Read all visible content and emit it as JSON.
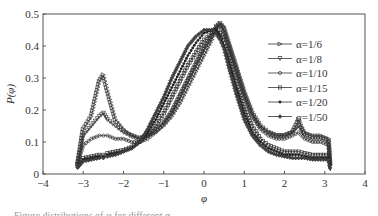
{
  "chart_data": {
    "type": "line",
    "title": "",
    "xlabel": "φ",
    "ylabel": "P(φ)",
    "xlim": [
      -4,
      4
    ],
    "ylim": [
      0,
      0.5
    ],
    "xticks": [
      "-4",
      "-3",
      "-2",
      "-1",
      "0",
      "1",
      "2",
      "3",
      "4"
    ],
    "yticks": [
      "0",
      "0.1",
      "0.2",
      "0.3",
      "0.4",
      "0.5"
    ],
    "grid": false,
    "legend_position": "upper right",
    "x": [
      -3.14,
      -3.0,
      -2.8,
      -2.6,
      -2.5,
      -2.4,
      -2.2,
      -2.0,
      -1.8,
      -1.6,
      -1.4,
      -1.2,
      -1.0,
      -0.8,
      -0.6,
      -0.4,
      -0.2,
      0.0,
      0.2,
      0.3,
      0.4,
      0.5,
      0.6,
      0.8,
      1.0,
      1.2,
      1.4,
      1.6,
      1.8,
      2.0,
      2.2,
      2.35,
      2.5,
      2.7,
      2.9,
      3.1,
      3.14
    ],
    "series": [
      {
        "name": "α=1/6",
        "marker": "triangle-right",
        "values": [
          0.03,
          0.14,
          0.18,
          0.29,
          0.31,
          0.26,
          0.17,
          0.14,
          0.12,
          0.11,
          0.12,
          0.13,
          0.15,
          0.18,
          0.22,
          0.27,
          0.32,
          0.37,
          0.42,
          0.45,
          0.47,
          0.46,
          0.42,
          0.34,
          0.26,
          0.19,
          0.15,
          0.13,
          0.12,
          0.12,
          0.13,
          0.17,
          0.13,
          0.12,
          0.12,
          0.11,
          0.02
        ]
      },
      {
        "name": "α=1/8",
        "marker": "triangle-down",
        "values": [
          0.03,
          0.12,
          0.15,
          0.18,
          0.19,
          0.17,
          0.15,
          0.13,
          0.12,
          0.11,
          0.12,
          0.14,
          0.16,
          0.19,
          0.24,
          0.29,
          0.34,
          0.39,
          0.43,
          0.46,
          0.47,
          0.45,
          0.41,
          0.33,
          0.25,
          0.19,
          0.15,
          0.13,
          0.12,
          0.12,
          0.13,
          0.15,
          0.12,
          0.11,
          0.11,
          0.1,
          0.02
        ]
      },
      {
        "name": "α=1/10",
        "marker": "circle",
        "values": [
          0.03,
          0.09,
          0.11,
          0.12,
          0.12,
          0.12,
          0.11,
          0.11,
          0.1,
          0.1,
          0.11,
          0.13,
          0.16,
          0.2,
          0.25,
          0.3,
          0.35,
          0.4,
          0.44,
          0.46,
          0.46,
          0.44,
          0.4,
          0.32,
          0.24,
          0.18,
          0.14,
          0.12,
          0.11,
          0.11,
          0.12,
          0.13,
          0.11,
          0.1,
          0.1,
          0.09,
          0.02
        ]
      },
      {
        "name": "α=1/15",
        "marker": "square",
        "values": [
          0.03,
          0.05,
          0.055,
          0.06,
          0.06,
          0.065,
          0.07,
          0.075,
          0.085,
          0.1,
          0.12,
          0.15,
          0.19,
          0.24,
          0.29,
          0.34,
          0.38,
          0.42,
          0.44,
          0.45,
          0.44,
          0.42,
          0.38,
          0.29,
          0.21,
          0.15,
          0.11,
          0.09,
          0.08,
          0.07,
          0.07,
          0.07,
          0.065,
          0.06,
          0.06,
          0.06,
          0.02
        ]
      },
      {
        "name": "α=1/20",
        "marker": "dot",
        "values": [
          0.02,
          0.045,
          0.05,
          0.055,
          0.055,
          0.06,
          0.065,
          0.07,
          0.08,
          0.1,
          0.13,
          0.17,
          0.22,
          0.27,
          0.32,
          0.37,
          0.41,
          0.44,
          0.45,
          0.45,
          0.43,
          0.4,
          0.36,
          0.27,
          0.19,
          0.13,
          0.1,
          0.08,
          0.07,
          0.06,
          0.06,
          0.06,
          0.055,
          0.05,
          0.05,
          0.05,
          0.01
        ]
      },
      {
        "name": "α=1/50",
        "marker": "diamond",
        "values": [
          0.02,
          0.04,
          0.045,
          0.05,
          0.05,
          0.055,
          0.06,
          0.07,
          0.08,
          0.1,
          0.14,
          0.19,
          0.24,
          0.3,
          0.35,
          0.4,
          0.43,
          0.45,
          0.45,
          0.44,
          0.42,
          0.39,
          0.34,
          0.25,
          0.17,
          0.12,
          0.09,
          0.07,
          0.06,
          0.055,
          0.05,
          0.05,
          0.05,
          0.045,
          0.045,
          0.045,
          0.01
        ]
      }
    ]
  },
  "axes": {
    "xlabel": "φ",
    "ylabel": "P(φ)"
  },
  "legend": [
    "α=1/6",
    "α=1/8",
    "α=1/10",
    "α=1/15",
    "α=1/20",
    "α=1/50"
  ],
  "caption": "Figure distributions of φ for different α"
}
